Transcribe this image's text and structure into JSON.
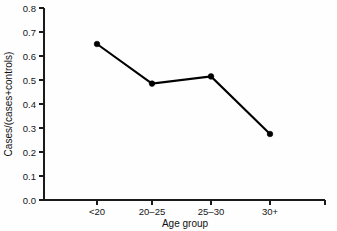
{
  "chart_data": {
    "type": "line",
    "title": "",
    "subtitle": "",
    "xlabel": "Age group",
    "ylabel": "Cases/(cases+controls)",
    "categories": [
      "<20",
      "20–25",
      "25–30",
      "30+"
    ],
    "values": [
      0.65,
      0.485,
      0.515,
      0.275
    ],
    "series": [
      {
        "name": "Cases/(cases+controls)",
        "values": [
          0.65,
          0.485,
          0.515,
          0.275
        ]
      }
    ],
    "ylim": [
      0.0,
      0.8
    ],
    "ytick_labels": [
      "0.0",
      "0.1",
      "0.2",
      "0.3",
      "0.4",
      "0.5",
      "0.6",
      "0.7",
      "0.8"
    ],
    "ytick_values": [
      0.0,
      0.1,
      0.2,
      0.3,
      0.4,
      0.5,
      0.6,
      0.7,
      0.8
    ],
    "xtick_labels": [
      "<20",
      "20–25",
      "25–30",
      "30+"
    ],
    "grid": false,
    "legend": false,
    "legend_position": "none",
    "marker": "filled-circle",
    "line_color": "#000000",
    "marker_color": "#000000",
    "background_color": "#fefefe",
    "axis_color": "#1a1a1a",
    "annotations": []
  },
  "geometry": {
    "plot_left": 44,
    "plot_right": 325,
    "plot_top": 8,
    "plot_bottom": 200,
    "x_positions": [
      97,
      152,
      211,
      270
    ],
    "y_value_top": 0.8,
    "y_value_bottom": 0.0
  }
}
